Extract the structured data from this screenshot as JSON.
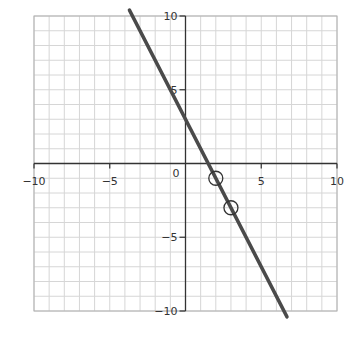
{
  "chart_data": {
    "type": "line",
    "title": "",
    "xlabel": "",
    "ylabel": "",
    "xlim": [
      -10,
      10
    ],
    "ylim": [
      -10,
      10
    ],
    "grid": true,
    "grid_step": 1,
    "x_ticks": [
      -10,
      -5,
      0,
      5,
      10
    ],
    "y_ticks": [
      -10,
      -5,
      5,
      10
    ],
    "x_tick_labels": [
      "−10",
      "−5",
      "0",
      "5",
      "10"
    ],
    "y_tick_labels": [
      "−10",
      "−5",
      "5",
      "10"
    ],
    "origin_label": "0",
    "series": [
      {
        "name": "y = -2x + 3",
        "slope": -2,
        "intercept": 3,
        "x": [
          -3.7,
          6.7
        ],
        "values": [
          10.4,
          -10.4
        ],
        "color": "#4a4a4a"
      }
    ],
    "highlighted_points": [
      {
        "x": 2,
        "y": -1
      },
      {
        "x": 3,
        "y": -3
      }
    ],
    "legend": null
  },
  "colors": {
    "grid": "#d6d6d6",
    "border": "#b0b0b0",
    "axis": "#333333",
    "line": "#4a4a4a",
    "marker": "#333333"
  }
}
